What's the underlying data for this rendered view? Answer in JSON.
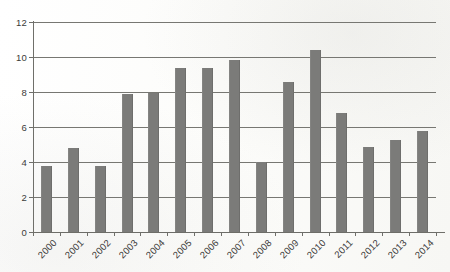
{
  "chart_data": {
    "type": "bar",
    "title": "",
    "subtitle": "",
    "xlabel": "",
    "ylabel": "",
    "categories": [
      "2000",
      "2001",
      "2002",
      "2003",
      "2004",
      "2005",
      "2006",
      "2007",
      "2008",
      "2009",
      "2010",
      "2011",
      "2012",
      "2013",
      "2014"
    ],
    "values": [
      3.8,
      4.8,
      3.8,
      7.9,
      7.95,
      9.4,
      9.4,
      9.85,
      4.0,
      8.55,
      10.4,
      6.8,
      4.85,
      5.25,
      5.8
    ],
    "series": [
      {
        "name": "",
        "values": [
          3.8,
          4.8,
          3.8,
          7.9,
          7.95,
          9.4,
          9.4,
          9.85,
          4.0,
          8.55,
          10.4,
          6.8,
          4.85,
          5.25,
          5.8
        ]
      }
    ],
    "ylim": [
      0,
      12
    ],
    "yticks": [
      0,
      2,
      4,
      6,
      8,
      10,
      12
    ],
    "ytick_labels": [
      "0",
      "2",
      "4",
      "6",
      "8",
      "10",
      "12"
    ],
    "grid": "horizontal",
    "legend": "none",
    "annotations": [],
    "colors": {
      "bar_fill": "#7b7b79",
      "gridline": "#777772",
      "axis": "#6f6f6a",
      "text": "#3b3b39",
      "background": "#fdfdfc"
    },
    "x_labels_rotation_deg": -45
  }
}
